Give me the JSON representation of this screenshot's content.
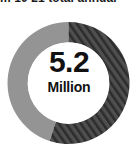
{
  "header": {
    "clipped_title": "m 10 21 total annual"
  },
  "center": {
    "value": "5.2",
    "unit": "Million"
  },
  "colors": {
    "segment_hatched_fill": "#4a4a4a",
    "segment_hatched_stripe": "#2b2b2b",
    "segment_solid": "#949494",
    "hole": "#ffffff",
    "text": "#111111",
    "background": "#ffffff"
  },
  "chart_data": {
    "type": "pie",
    "title": "",
    "subtitle": "",
    "xlabel": "",
    "ylabel": "",
    "center_value": "5.2",
    "center_unit": "Million",
    "donut": true,
    "inner_radius_ratio": 0.67,
    "start_angle_deg": 0,
    "direction": "clockwise",
    "legend": "none",
    "grid": false,
    "categories": [
      "Hatched segment",
      "Solid gray segment"
    ],
    "values": [
      55,
      45
    ],
    "value_unit": "percent",
    "series": [
      {
        "name": "Share",
        "values": [
          55,
          45
        ]
      }
    ],
    "slices": [
      {
        "label": "Hatched segment",
        "value": 55,
        "sweep_deg": 198,
        "start_deg": 0,
        "end_deg": 198,
        "fill": "#4a4a4a",
        "pattern": "diagonal-hatch"
      },
      {
        "label": "Solid gray segment",
        "value": 45,
        "sweep_deg": 162,
        "start_deg": 198,
        "end_deg": 360,
        "fill": "#949494",
        "pattern": "solid"
      }
    ]
  }
}
